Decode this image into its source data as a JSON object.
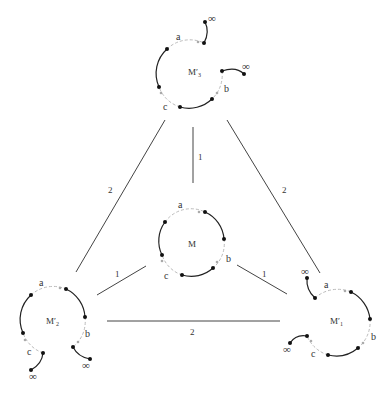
{
  "colors": {
    "solid": "#222222",
    "dashed": "#bbbbbb",
    "edge": "#444444",
    "dot": "#111111",
    "text": "#333333"
  },
  "nodes": {
    "center": {
      "label": "M",
      "a": "a",
      "b": "b",
      "c": "c"
    },
    "top": {
      "label": "M′",
      "sub": "3",
      "a": "a",
      "b": "b",
      "c": "c",
      "inf1": "∞",
      "inf2": "∞"
    },
    "left": {
      "label": "M′",
      "sub": "2",
      "a": "a",
      "b": "b",
      "c": "c",
      "inf1": "∞",
      "inf2": "∞"
    },
    "right": {
      "label": "M′",
      "sub": "1",
      "a": "a",
      "b": "b",
      "c": "c",
      "inf1": "∞",
      "inf2": "∞"
    }
  },
  "edges": [
    {
      "from": "top",
      "to": "center",
      "weight": "1"
    },
    {
      "from": "top",
      "to": "left",
      "weight": "2"
    },
    {
      "from": "top",
      "to": "right",
      "weight": "2"
    },
    {
      "from": "left",
      "to": "center",
      "weight": "1"
    },
    {
      "from": "right",
      "to": "center",
      "weight": "1"
    },
    {
      "from": "left",
      "to": "right",
      "weight": "2"
    }
  ]
}
